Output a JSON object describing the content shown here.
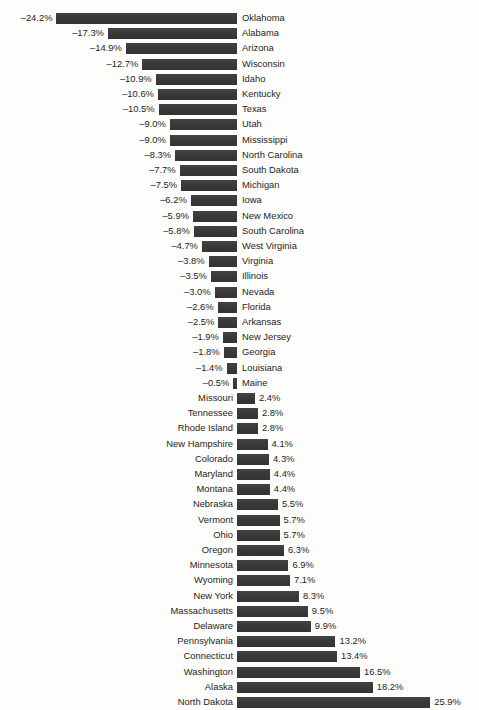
{
  "chart_data": {
    "type": "bar",
    "orientation": "horizontal",
    "title": "",
    "subtitle": "",
    "xlabel": "",
    "ylabel": "",
    "grid": false,
    "legend": null,
    "zero_axis": true,
    "value_suffix": "%",
    "negative_sign": "–",
    "xlim": [
      -24.2,
      25.9
    ],
    "bar_color": "#3b3b3b",
    "background_color": "#fdfdfc",
    "text_color": "#1d1d1d",
    "categories": [
      "Oklahoma",
      "Alabama",
      "Arizona",
      "Wisconsin",
      "Idaho",
      "Kentucky",
      "Texas",
      "Utah",
      "Mississippi",
      "North Carolina",
      "South Dakota",
      "Michigan",
      "Iowa",
      "New Mexico",
      "South Carolina",
      "West Virginia",
      "Virginia",
      "Illinois",
      "Nevada",
      "Florida",
      "Arkansas",
      "New Jersey",
      "Georgia",
      "Louisiana",
      "Maine",
      "Missouri",
      "Tennessee",
      "Rhode Island",
      "New Hampshire",
      "Colorado",
      "Maryland",
      "Montana",
      "Nebraska",
      "Vermont",
      "Ohio",
      "Oregon",
      "Minnesota",
      "Wyoming",
      "New York",
      "Massachusetts",
      "Delaware",
      "Pennsylvania",
      "Connecticut",
      "Washington",
      "Alaska",
      "North Dakota"
    ],
    "values": [
      -24.2,
      -17.3,
      -14.9,
      -12.7,
      -10.9,
      -10.6,
      -10.5,
      -9.0,
      -9.0,
      -8.3,
      -7.7,
      -7.5,
      -6.2,
      -5.9,
      -5.8,
      -4.7,
      -3.8,
      -3.5,
      -3.0,
      -2.6,
      -2.5,
      -1.9,
      -1.8,
      -1.4,
      -0.5,
      2.4,
      2.8,
      2.8,
      4.1,
      4.3,
      4.4,
      4.4,
      5.5,
      5.7,
      5.7,
      6.3,
      6.9,
      7.1,
      8.3,
      9.5,
      9.9,
      13.2,
      13.4,
      16.5,
      18.2,
      25.9
    ],
    "value_labels": [
      "–24.2%",
      "–17.3%",
      "–14.9%",
      "–12.7%",
      "–10.9%",
      "–10.6%",
      "–10.5%",
      "–9.0%",
      "–9.0%",
      "–8.3%",
      "–7.7%",
      "–7.5%",
      "–6.2%",
      "–5.9%",
      "–5.8%",
      "–4.7%",
      "–3.8%",
      "–3.5%",
      "–3.0%",
      "–2.6%",
      "–2.5%",
      "–1.9%",
      "–1.8%",
      "–1.4%",
      "–0.5%",
      "2.4%",
      "2.8%",
      "2.8%",
      "4.1%",
      "4.3%",
      "4.4%",
      "4.4%",
      "5.5%",
      "5.7%",
      "5.7%",
      "6.3%",
      "6.9%",
      "7.1%",
      "8.3%",
      "9.5%",
      "9.9%",
      "13.2%",
      "13.4%",
      "16.5%",
      "18.2%",
      "25.9%"
    ]
  },
  "layout": {
    "axis_x": 237,
    "px_per_unit": 7.46,
    "row_pitch": 15.2,
    "first_row_top": 11,
    "bar_height": 11,
    "label_gap": 4
  }
}
